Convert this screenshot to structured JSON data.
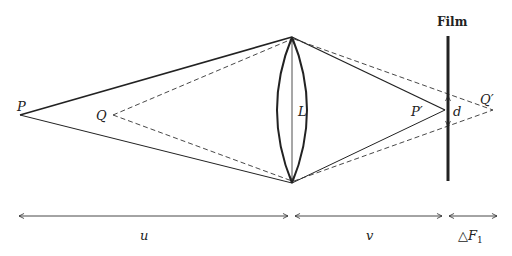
{
  "labels": {
    "P": "P",
    "Q": "Q",
    "L": "L",
    "P_prime": "P′",
    "Q_prime": "Q′",
    "d": "d",
    "film": "Film",
    "u": "u",
    "v": "v",
    "delta_F1": "△F",
    "delta_F1_sub": "1"
  },
  "colors": {
    "ink": "#222222",
    "background": "#ffffff"
  },
  "geometry": {
    "P": [
      20,
      115
    ],
    "Q": [
      113,
      115
    ],
    "lens_top": [
      292,
      37
    ],
    "lens_bottom": [
      292,
      183
    ],
    "P_prime": [
      445,
      110
    ],
    "Q_prime": [
      493,
      110
    ],
    "film_x": 448,
    "film_top": 36,
    "film_bottom": 181
  }
}
